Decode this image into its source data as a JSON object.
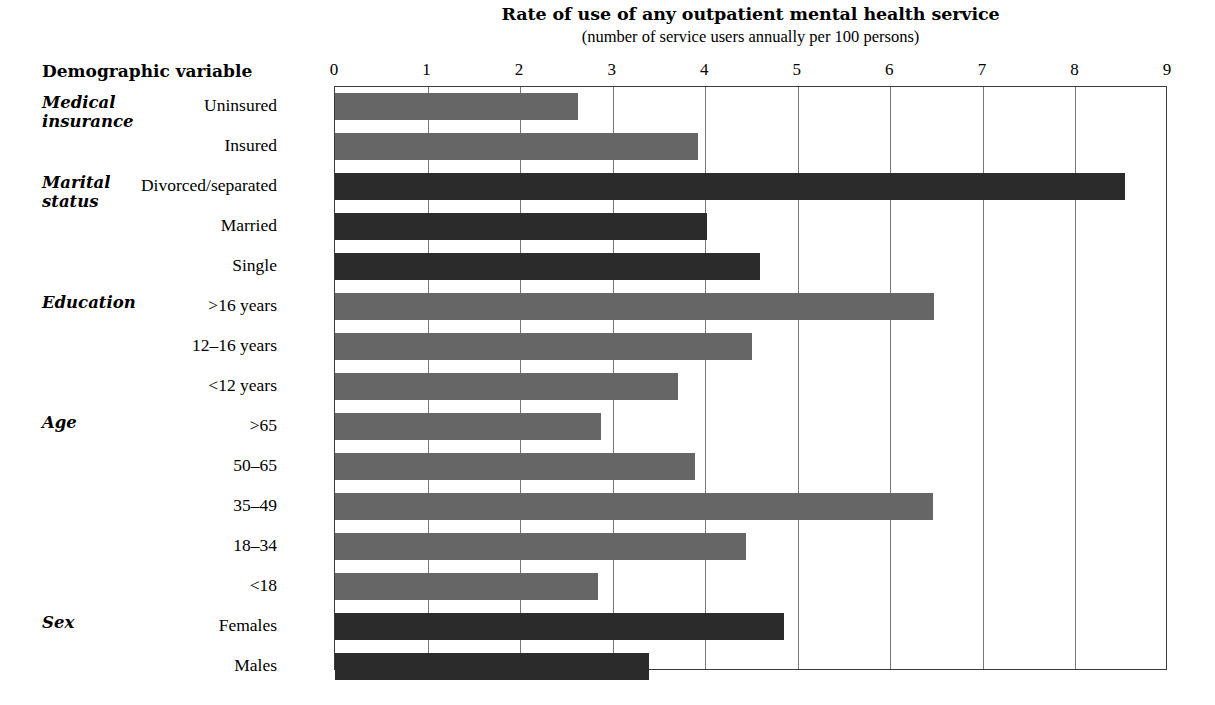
{
  "header": {
    "demographic_column_label": "Demographic variable"
  },
  "chart_data": {
    "type": "bar",
    "orientation": "horizontal",
    "title": "Rate of use of any outpatient mental health service",
    "subtitle": "(number of service users annually per 100 persons)",
    "xlabel": "",
    "ylabel": "Demographic variable",
    "xlim": [
      0,
      9
    ],
    "xticks": [
      0,
      1,
      2,
      3,
      4,
      5,
      6,
      7,
      8,
      9
    ],
    "xtick_labels": [
      "0",
      "1",
      "2",
      "3",
      "4",
      "5",
      "6",
      "7",
      "8",
      "9"
    ],
    "grid": "vertical",
    "legend": "none",
    "colors": {
      "shade_medium_gray": "#666666",
      "shade_dark": "#2b2b2b",
      "axis_border": "#3a3a3a",
      "gridline": "#777777",
      "background": "#ffffff"
    },
    "groups": [
      {
        "name": "Medical insurance",
        "label_lines": "Medical\ninsurance",
        "color": "#666666",
        "categories": [
          "Uninsured",
          "Insured"
        ],
        "values": [
          2.63,
          3.92
        ]
      },
      {
        "name": "Marital status",
        "label_lines": "Marital\nstatus",
        "color": "#2b2b2b",
        "categories": [
          "Divorced/separated",
          "Married",
          "Single"
        ],
        "values": [
          8.54,
          4.02,
          4.59
        ]
      },
      {
        "name": "Education",
        "label_lines": "Education",
        "color": "#666666",
        "categories": [
          ">16 years",
          "12–16 years",
          "<12 years"
        ],
        "values": [
          6.47,
          4.5,
          3.71
        ]
      },
      {
        "name": "Age",
        "label_lines": "Age",
        "color": "#666666",
        "categories": [
          ">65",
          "50–65",
          "35–49",
          "18–34",
          "<18"
        ],
        "values": [
          2.87,
          3.89,
          6.46,
          4.44,
          2.84
        ]
      },
      {
        "name": "Sex",
        "label_lines": "Sex",
        "color": "#2b2b2b",
        "categories": [
          "Females",
          "Males"
        ],
        "values": [
          4.85,
          3.39
        ]
      }
    ],
    "categories": [
      "Uninsured",
      "Insured",
      "Divorced/separated",
      "Married",
      "Single",
      ">16 years",
      "12–16 years",
      "<12 years",
      ">65",
      "50–65",
      "35–49",
      "18–34",
      "<18",
      "Females",
      "Males"
    ],
    "values": [
      2.63,
      3.92,
      8.54,
      4.02,
      4.59,
      6.47,
      4.5,
      3.71,
      2.87,
      3.89,
      6.46,
      4.44,
      2.84,
      4.85,
      3.39
    ]
  }
}
